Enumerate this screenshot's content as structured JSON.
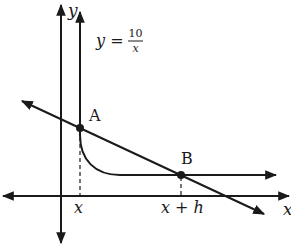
{
  "diagram": {
    "type": "secant-line-on-hyperbola",
    "axes": {
      "x_label": "x",
      "y_label": "y"
    },
    "equation": {
      "lhs": "y =",
      "numerator": "10",
      "denominator": "x"
    },
    "points": [
      {
        "label": "A",
        "x_label": "x"
      },
      {
        "label": "B",
        "x_label": "x + h"
      }
    ],
    "colors": {
      "ink": "#1a1a1a",
      "background": "#ffffff"
    }
  }
}
